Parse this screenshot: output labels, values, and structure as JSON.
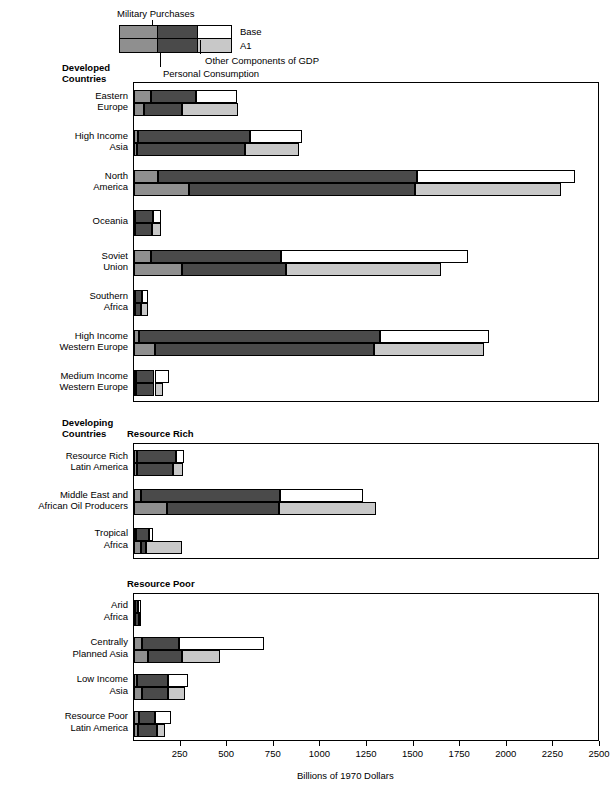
{
  "legend": {
    "military_label": "Military Purchases",
    "personal_label": "Personal Consumption",
    "other_label": "Other Components of GDP",
    "row_base_label": "Base",
    "row_a1_label": "A1"
  },
  "groups": {
    "developed_line1": "Developed",
    "developed_line2": "Countries",
    "developing_line1": "Developing",
    "developing_line2": "Countries",
    "resource_rich": "Resource Rich",
    "resource_poor": "Resource Poor"
  },
  "axis": {
    "title": "Billions of 1970 Dollars",
    "ticks": [
      "250",
      "500",
      "750",
      "1000",
      "1250",
      "1500",
      "1750",
      "2000",
      "2250",
      "2500"
    ],
    "min": 0,
    "max": 2500,
    "step": 250
  },
  "colors": {
    "military": "#8f8f8f",
    "personal": "#4a4a4a",
    "other": "#ffffff",
    "other_a1": "#c8c8c8",
    "outline": "#000000"
  },
  "chart_data": {
    "type": "bar",
    "orientation": "horizontal",
    "title": "",
    "xlabel": "Billions of 1970 Dollars",
    "ylabel": "",
    "xlim": [
      0,
      2500
    ],
    "grid": true,
    "stacked": true,
    "segments": [
      "Military Purchases",
      "Personal Consumption",
      "Other Components of GDP"
    ],
    "scenarios": [
      "Base",
      "A1"
    ],
    "panels": [
      {
        "name": "Developed Countries",
        "categories": [
          {
            "label_lines": [
              "Eastern",
              "Europe"
            ],
            "Base": {
              "military": 90,
              "personal": 245,
              "other": 215,
              "total": 550
            },
            "A1": {
              "military": 55,
              "personal": 200,
              "other": 305,
              "total": 560
            }
          },
          {
            "label_lines": [
              "High Income",
              "Asia"
            ],
            "Base": {
              "military": 20,
              "personal": 600,
              "other": 280,
              "total": 900
            },
            "A1": {
              "military": 15,
              "personal": 580,
              "other": 290,
              "total": 885
            }
          },
          {
            "label_lines": [
              "North",
              "America"
            ],
            "Base": {
              "military": 130,
              "personal": 1390,
              "other": 845,
              "total": 2365
            },
            "A1": {
              "military": 295,
              "personal": 1215,
              "other": 780,
              "total": 2290
            }
          },
          {
            "label_lines": [
              "Oceania"
            ],
            "Base": {
              "military": 5,
              "personal": 95,
              "other": 45,
              "total": 145
            },
            "A1": {
              "military": 5,
              "personal": 90,
              "other": 50,
              "total": 145
            }
          },
          {
            "label_lines": [
              "Soviet",
              "Union"
            ],
            "Base": {
              "military": 90,
              "personal": 700,
              "other": 1000,
              "total": 1790
            },
            "A1": {
              "military": 255,
              "personal": 560,
              "other": 830,
              "total": 1645
            }
          },
          {
            "label_lines": [
              "Southern",
              "Africa"
            ],
            "Base": {
              "military": 5,
              "personal": 40,
              "other": 30,
              "total": 75
            },
            "A1": {
              "military": 5,
              "personal": 35,
              "other": 35,
              "total": 75
            }
          },
          {
            "label_lines": [
              "High Income",
              "Western Europe"
            ],
            "Base": {
              "military": 25,
              "personal": 1295,
              "other": 585,
              "total": 1905
            },
            "A1": {
              "military": 110,
              "personal": 1175,
              "other": 595,
              "total": 1880
            }
          },
          {
            "label_lines": [
              "Medium Income",
              "Western Europe"
            ],
            "Base": {
              "military": 10,
              "personal": 100,
              "other": 80,
              "total": 190
            },
            "A1": {
              "military": 10,
              "personal": 100,
              "other": 45,
              "total": 155
            }
          }
        ]
      },
      {
        "name": "Resource Rich",
        "categories": [
          {
            "label_lines": [
              "Resource Rich",
              "Latin America"
            ],
            "Base": {
              "military": 15,
              "personal": 210,
              "other": 45,
              "total": 270
            },
            "A1": {
              "military": 15,
              "personal": 195,
              "other": 55,
              "total": 265
            }
          },
          {
            "label_lines": [
              "Middle East and",
              "African Oil Producers"
            ],
            "Base": {
              "military": 40,
              "personal": 745,
              "other": 445,
              "total": 1230
            },
            "A1": {
              "military": 175,
              "personal": 605,
              "other": 520,
              "total": 1300
            }
          },
          {
            "label_lines": [
              "Tropical",
              "Africa"
            ],
            "Base": {
              "military": 10,
              "personal": 70,
              "other": 20,
              "total": 100
            },
            "A1": {
              "military": 35,
              "personal": 30,
              "other": 190,
              "total": 255
            }
          }
        ]
      },
      {
        "name": "Resource Poor",
        "categories": [
          {
            "label_lines": [
              "Arid",
              "Africa"
            ],
            "Base": {
              "military": 5,
              "personal": 15,
              "other": 20,
              "total": 40
            },
            "A1": {
              "military": 5,
              "personal": 20,
              "other": 5,
              "total": 30
            }
          },
          {
            "label_lines": [
              "Centrally",
              "Planned Asia"
            ],
            "Base": {
              "military": 45,
              "personal": 195,
              "other": 460,
              "total": 700
            },
            "A1": {
              "military": 75,
              "personal": 180,
              "other": 205,
              "total": 460
            }
          },
          {
            "label_lines": [
              "Low Income",
              "Asia"
            ],
            "Base": {
              "military": 15,
              "personal": 165,
              "other": 110,
              "total": 290
            },
            "A1": {
              "military": 45,
              "personal": 140,
              "other": 90,
              "total": 275
            }
          },
          {
            "label_lines": [
              "Resource Poor",
              "Latin America"
            ],
            "Base": {
              "military": 25,
              "personal": 90,
              "other": 85,
              "total": 200
            },
            "A1": {
              "military": 20,
              "personal": 105,
              "other": 40,
              "total": 165
            }
          }
        ]
      }
    ]
  }
}
